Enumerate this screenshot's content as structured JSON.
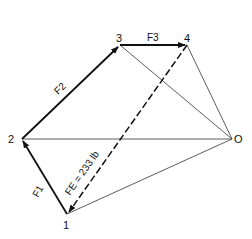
{
  "diagram": {
    "type": "force-polygon",
    "points": {
      "p1": {
        "label": "1",
        "x": 67,
        "y": 214
      },
      "p2": {
        "label": "2",
        "x": 22,
        "y": 139
      },
      "p3": {
        "label": "3",
        "x": 120,
        "y": 45
      },
      "p4": {
        "label": "4",
        "x": 187,
        "y": 45
      },
      "pO": {
        "label": "O",
        "x": 232,
        "y": 139
      }
    },
    "vectors": {
      "f1": {
        "label": "F1",
        "from": "1",
        "to": "2"
      },
      "f2": {
        "label": "F2",
        "from": "2",
        "to": "3"
      },
      "f3": {
        "label": "F3",
        "from": "3",
        "to": "4"
      },
      "fe": {
        "label": "FE = 233 lb",
        "from": "4",
        "to": "1",
        "style": "dashed"
      }
    },
    "rays": [
      "O-1",
      "O-2",
      "O-3",
      "O-4"
    ]
  }
}
